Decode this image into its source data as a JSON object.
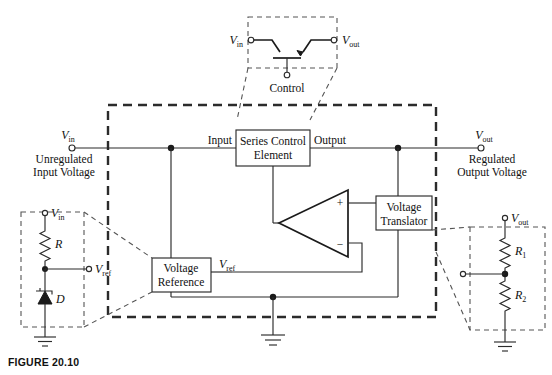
{
  "figure": {
    "caption": "FIGURE 20.10"
  },
  "colors": {
    "line": "#2b2b2b",
    "line_dark": "#1a1a1a",
    "dashed_boundary": "#2b2b2b",
    "callout_dashed": "#555555",
    "background": "#ffffff"
  },
  "detail_transistor": {
    "name": "pass-transistor-detail",
    "input_label": "V",
    "input_sub": "in",
    "output_label": "V",
    "output_sub": "out",
    "control_label": "Control"
  },
  "main": {
    "input_terminal": {
      "label": "V",
      "sub": "in",
      "caption_line1": "Unregulated",
      "caption_line2": "Input Voltage"
    },
    "output_terminal": {
      "label": "V",
      "sub": "out",
      "caption_line1": "Regulated",
      "caption_line2": "Output Voltage"
    },
    "series_control_element": {
      "line1": "Series Control",
      "line2": "Element",
      "port_in": "Input",
      "port_out": "Output"
    },
    "voltage_reference": {
      "line1": "Voltage",
      "line2": "Reference",
      "out_label": "V",
      "out_sub": "ref"
    },
    "voltage_translator": {
      "line1": "Voltage",
      "line2": "Translator"
    },
    "amplifier": {
      "plus": "+",
      "minus": "−"
    }
  },
  "detail_reference": {
    "name": "voltage-reference-detail",
    "supply_label": "V",
    "supply_sub": "in",
    "resistor_label": "R",
    "diode_label": "D",
    "out_label": "V",
    "out_sub": "ref"
  },
  "detail_divider": {
    "name": "output-divider-detail",
    "supply_label": "V",
    "supply_sub": "out",
    "resistor1_label": "R",
    "resistor1_sub": "1",
    "resistor2_label": "R",
    "resistor2_sub": "2"
  }
}
